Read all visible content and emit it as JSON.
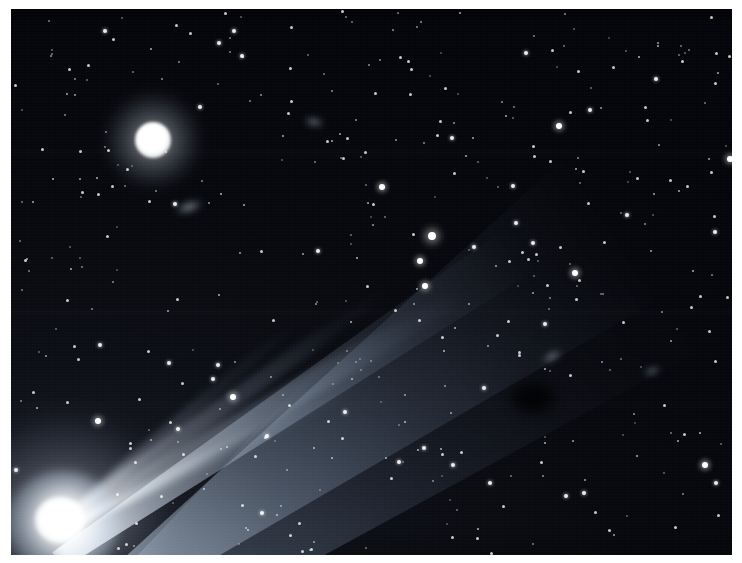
{
  "image": {
    "kind": "astronomical-photograph",
    "subject": "comet",
    "title": "Comet with broad dust tail over dense star field",
    "orientation": "landscape",
    "frame": {
      "border_color": "#ffffff",
      "border_px": {
        "left": 11,
        "top": 9,
        "right": 10,
        "bottom": 8
      },
      "plate_width": 721,
      "plate_height": 546
    },
    "palette": {
      "sky_dark": "#05060a",
      "sky_mid": "#12151d",
      "sky_light": "#1a1d26",
      "star_white": "#ffffff",
      "tail_blue_white": "#c8dcf0",
      "tail_faint": "#6e8aac",
      "paper_white": "#ffffff"
    },
    "features": [
      {
        "name": "comet-nucleus",
        "label": "Comet nucleus",
        "center": [
          48,
          512
        ],
        "core_radius_px": 24,
        "brightness": "saturated white"
      },
      {
        "name": "comet-coma",
        "label": "Coma",
        "center": [
          50,
          512
        ],
        "glow_radius_px": 95,
        "brightness": "bright diffuse halo"
      },
      {
        "name": "comet-tail",
        "label": "Dust tail fan",
        "origin": [
          50,
          510
        ],
        "direction_degrees": -34,
        "length_px": 720,
        "opening_angle_degrees": 22,
        "description": "Broad fan widening toward the upper right, crossing the frame to the top-right corner"
      },
      {
        "name": "ion-jets",
        "label": "Narrow tail filaments",
        "count": 4,
        "description": "Thin bright strands emerging from the coma along the lower ridge of the fan"
      },
      {
        "name": "bright-star",
        "label": "Bright foreground star",
        "center": [
          142,
          131
        ],
        "disc_radius_px": 18,
        "glow_radius_px": 45
      },
      {
        "name": "dark-blotch",
        "label": "Dark plate blemish",
        "center": [
          522,
          389
        ]
      }
    ],
    "star_count_visible": 430
  },
  "caption": ""
}
